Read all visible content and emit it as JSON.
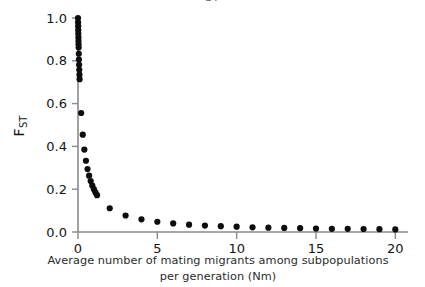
{
  "figure": {
    "title_fragment": "ST",
    "background": "#ffffff",
    "point_color": "#0d0d0d",
    "axis_color": "#8a8a8a"
  },
  "axes": {
    "y_label_main": "F",
    "y_label_sub": "ST",
    "x_caption_line1": "Average number of mating migrants among subpopulations",
    "x_caption_line2": "per generation (Nm)",
    "x_ticks": [
      "0",
      "5",
      "10",
      "15",
      "20"
    ],
    "y_ticks": [
      "0.0",
      "0.2",
      "0.4",
      "0.6",
      "0.8",
      "1.0"
    ]
  },
  "chart_data": {
    "type": "scatter",
    "title": "ST",
    "xlabel": "Average number of mating migrants among subpopulations per generation (Nm)",
    "ylabel": "F_ST",
    "xlim": [
      0,
      20.8
    ],
    "ylim": [
      0,
      1.0
    ],
    "xticks": [
      0,
      5,
      10,
      15,
      20
    ],
    "yticks": [
      0.0,
      0.2,
      0.4,
      0.6,
      0.8,
      1.0
    ],
    "grid": false,
    "legend": null,
    "marker": "filled-circle",
    "relation": "F_ST = 1 / (1 + 4Nm)",
    "x": [
      0.0,
      0.005,
      0.01,
      0.015,
      0.02,
      0.025,
      0.03,
      0.035,
      0.04,
      0.05,
      0.06,
      0.07,
      0.08,
      0.09,
      0.1,
      0.2,
      0.3,
      0.4,
      0.5,
      0.6,
      0.7,
      0.8,
      0.9,
      1.0,
      1.1,
      1.2,
      2.0,
      3.0,
      4.0,
      5.0,
      6.0,
      7.0,
      8.0,
      9.0,
      10.0,
      11.0,
      12.0,
      13.0,
      14.0,
      15.0,
      16.0,
      17.0,
      18.0,
      19.0,
      20.0
    ],
    "y": [
      1.0,
      0.98,
      0.962,
      0.943,
      0.926,
      0.909,
      0.893,
      0.877,
      0.862,
      0.833,
      0.806,
      0.781,
      0.758,
      0.735,
      0.714,
      0.556,
      0.455,
      0.385,
      0.333,
      0.294,
      0.263,
      0.238,
      0.217,
      0.2,
      0.185,
      0.172,
      0.111,
      0.077,
      0.059,
      0.048,
      0.04,
      0.034,
      0.03,
      0.027,
      0.025,
      0.022,
      0.02,
      0.019,
      0.018,
      0.016,
      0.015,
      0.015,
      0.014,
      0.013,
      0.012
    ]
  }
}
